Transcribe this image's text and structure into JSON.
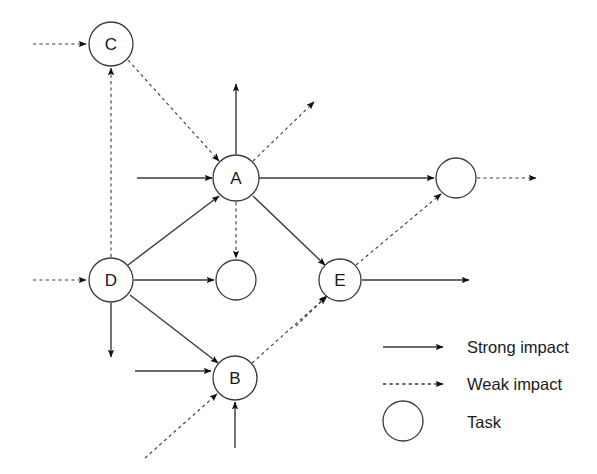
{
  "diagram": {
    "node_radius": 22,
    "colors": {
      "stroke": "#3a3a3a",
      "arrow": "#1a1a1a",
      "text": "#1a1a1a",
      "background": "#ffffff"
    },
    "nodes": [
      {
        "id": "C",
        "label": "C",
        "cx": 111,
        "cy": 44,
        "r": 22
      },
      {
        "id": "A",
        "label": "A",
        "cx": 236,
        "cy": 178,
        "r": 23
      },
      {
        "id": "D",
        "label": "D",
        "cx": 111,
        "cy": 280,
        "r": 22
      },
      {
        "id": "T1",
        "label": "",
        "cx": 236,
        "cy": 280,
        "r": 20
      },
      {
        "id": "E",
        "label": "E",
        "cx": 340,
        "cy": 280,
        "r": 21
      },
      {
        "id": "T2",
        "label": "",
        "cx": 456,
        "cy": 178,
        "r": 20
      },
      {
        "id": "B",
        "label": "B",
        "cx": 235,
        "cy": 378,
        "r": 22
      }
    ],
    "edges": [
      {
        "from": "external",
        "to": "C",
        "kind": "weak",
        "x1": 33,
        "y1": 44,
        "x2": 86,
        "y2": 44
      },
      {
        "from": "D",
        "to": "C",
        "kind": "weak",
        "x1": 111,
        "y1": 257,
        "x2": 111,
        "y2": 68
      },
      {
        "from": "C",
        "to": "A",
        "kind": "weak",
        "x1": 128,
        "y1": 60,
        "x2": 219,
        "y2": 161
      },
      {
        "from": "A",
        "to": "up",
        "kind": "strong",
        "x1": 236,
        "y1": 154,
        "x2": 236,
        "y2": 84
      },
      {
        "from": "A",
        "to": "upright",
        "kind": "weak",
        "x1": 253,
        "y1": 161,
        "x2": 314,
        "y2": 102
      },
      {
        "from": "external",
        "to": "A",
        "kind": "strong",
        "x1": 137,
        "y1": 178,
        "x2": 212,
        "y2": 178
      },
      {
        "from": "A",
        "to": "T2",
        "kind": "strong",
        "x1": 259,
        "y1": 178,
        "x2": 434,
        "y2": 178
      },
      {
        "from": "A",
        "to": "T1",
        "kind": "weak",
        "x1": 236,
        "y1": 202,
        "x2": 236,
        "y2": 258
      },
      {
        "from": "D",
        "to": "A",
        "kind": "strong",
        "x1": 128,
        "y1": 265,
        "x2": 219,
        "y2": 196
      },
      {
        "from": "external",
        "to": "D",
        "kind": "weak",
        "x1": 33,
        "y1": 280,
        "x2": 86,
        "y2": 280
      },
      {
        "from": "D",
        "to": "T1",
        "kind": "strong",
        "x1": 134,
        "y1": 280,
        "x2": 214,
        "y2": 280
      },
      {
        "from": "D",
        "to": "down",
        "kind": "strong",
        "x1": 111,
        "y1": 303,
        "x2": 111,
        "y2": 357
      },
      {
        "from": "D",
        "to": "B",
        "kind": "strong",
        "x1": 130,
        "y1": 295,
        "x2": 218,
        "y2": 363
      },
      {
        "from": "A",
        "to": "E",
        "kind": "strong",
        "x1": 253,
        "y1": 196,
        "x2": 325,
        "y2": 265
      },
      {
        "from": "B",
        "to": "E",
        "kind": "weak",
        "x1": 252,
        "y1": 363,
        "x2": 327,
        "y2": 296
      },
      {
        "from": "E",
        "to": "T2",
        "kind": "weak",
        "x1": 356,
        "y1": 265,
        "x2": 441,
        "y2": 194
      },
      {
        "from": "E",
        "to": "right",
        "kind": "strong",
        "x1": 362,
        "y1": 280,
        "x2": 469,
        "y2": 280
      },
      {
        "from": "external",
        "to": "E",
        "kind": "weak",
        "x1": 296,
        "y1": 326,
        "x2": 326,
        "y2": 297
      },
      {
        "from": "T2",
        "to": "right",
        "kind": "weak",
        "x1": 477,
        "y1": 178,
        "x2": 536,
        "y2": 178
      },
      {
        "from": "external",
        "to": "B",
        "kind": "strong",
        "x1": 135,
        "y1": 371,
        "x2": 211,
        "y2": 371
      },
      {
        "from": "external",
        "to": "B",
        "kind": "weak",
        "x1": 145,
        "y1": 458,
        "x2": 217,
        "y2": 394
      },
      {
        "from": "external",
        "to": "B",
        "kind": "strong",
        "x1": 235,
        "y1": 448,
        "x2": 235,
        "y2": 402
      }
    ]
  },
  "legend": {
    "items": [
      {
        "symbol": "arrow-solid",
        "label": "Strong impact"
      },
      {
        "symbol": "arrow-dashed",
        "label": "Weak impact"
      },
      {
        "symbol": "circle",
        "label": "Task"
      }
    ]
  }
}
